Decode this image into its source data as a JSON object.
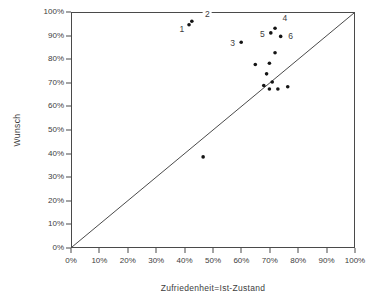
{
  "chart_data": {
    "type": "scatter",
    "title": "",
    "xlabel": "Zufriedenheit=Ist-Zustand",
    "ylabel": "Wunsch",
    "xlim": [
      0,
      100
    ],
    "ylim": [
      0,
      100
    ],
    "grid": false,
    "framed": true,
    "legend": "none",
    "x_tick_labels": [
      "0%",
      "10%",
      "20%",
      "30%",
      "40%",
      "50%",
      "60%",
      "70%",
      "80%",
      "90%",
      "100%"
    ],
    "y_tick_labels": [
      "0%",
      "10%",
      "20%",
      "30%",
      "40%",
      "50%",
      "60%",
      "70%",
      "80%",
      "90%",
      "100%"
    ],
    "diagonal_line": {
      "from": [
        0,
        0
      ],
      "to": [
        100,
        100
      ]
    },
    "point_color": "#141414",
    "line_color": "#4a4a4a",
    "points": [
      {
        "label": "1",
        "x": 41.5,
        "y": 95,
        "label_at": [
          39,
          93
        ]
      },
      {
        "label": "2",
        "x": 42.5,
        "y": 96.5,
        "label_at": [
          48,
          99.5
        ]
      },
      {
        "label": "3",
        "x": 60,
        "y": 87.5,
        "label_at": [
          57,
          87
        ]
      },
      {
        "label": "4",
        "x": 72,
        "y": 93.5,
        "label_at": [
          75.5,
          98
        ]
      },
      {
        "label": "5",
        "x": 70.5,
        "y": 91.5,
        "label_at": [
          67.5,
          91
        ]
      },
      {
        "label": "6",
        "x": 74,
        "y": 90,
        "label_at": [
          77.5,
          90
        ]
      },
      {
        "x": 72,
        "y": 83
      },
      {
        "x": 65,
        "y": 78
      },
      {
        "x": 70,
        "y": 78.5
      },
      {
        "x": 69,
        "y": 74
      },
      {
        "x": 71,
        "y": 70.5
      },
      {
        "x": 68,
        "y": 69
      },
      {
        "x": 76.5,
        "y": 68.5
      },
      {
        "x": 70,
        "y": 67.5
      },
      {
        "x": 73,
        "y": 67.5
      },
      {
        "x": 46.5,
        "y": 38.5
      }
    ]
  }
}
